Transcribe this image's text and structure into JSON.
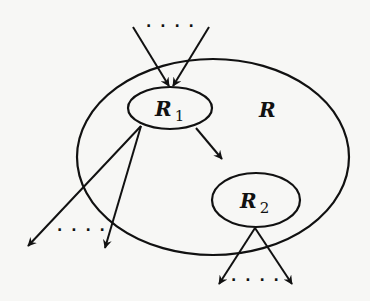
{
  "diagram": {
    "type": "region-nesting",
    "regions": [
      {
        "id": "R",
        "label": "R",
        "subscript": "",
        "shape": "ellipse",
        "cx": 213,
        "cy": 157,
        "rx": 136,
        "ry": 98,
        "label_x": 259,
        "label_y": 117
      },
      {
        "id": "R1",
        "label": "R",
        "subscript": "1",
        "shape": "ellipse",
        "cx": 170,
        "cy": 108,
        "rx": 42,
        "ry": 21,
        "label_x": 155,
        "label_y": 116
      },
      {
        "id": "R2",
        "label": "R",
        "subscript": "2",
        "shape": "ellipse",
        "cx": 256,
        "cy": 200,
        "rx": 44,
        "ry": 27,
        "label_x": 240,
        "label_y": 208
      }
    ],
    "edges": [
      {
        "from": "outside",
        "to": "R1",
        "x1": 133,
        "y1": 27,
        "x2": 169,
        "y2": 86
      },
      {
        "from": "outside",
        "to": "R1",
        "x1": 209,
        "y1": 27,
        "x2": 173,
        "y2": 86
      },
      {
        "from": "R1",
        "to": "outside",
        "x1": 141,
        "y1": 126,
        "x2": 28,
        "y2": 246
      },
      {
        "from": "R1",
        "to": "outside",
        "x1": 141,
        "y1": 126,
        "x2": 105,
        "y2": 248
      },
      {
        "from": "R1",
        "to": "R2",
        "x1": 196,
        "y1": 128,
        "x2": 222,
        "y2": 159
      },
      {
        "from": "R2",
        "to": "outside",
        "x1": 255,
        "y1": 228,
        "x2": 219,
        "y2": 284
      },
      {
        "from": "R2",
        "to": "outside",
        "x1": 255,
        "y1": 228,
        "x2": 292,
        "y2": 284
      }
    ],
    "ellipses_dots": [
      {
        "text": "· · · ·",
        "x": 171,
        "y": 31,
        "meaning": "more incoming edges"
      },
      {
        "text": "· · · ·",
        "x": 82,
        "y": 235,
        "meaning": "more outgoing edges from R1"
      },
      {
        "text": "· · · ·",
        "x": 256,
        "y": 285,
        "meaning": "more outgoing edges from R2"
      }
    ],
    "stroke_color": "#111111",
    "background_color": "#f7f7f5"
  }
}
